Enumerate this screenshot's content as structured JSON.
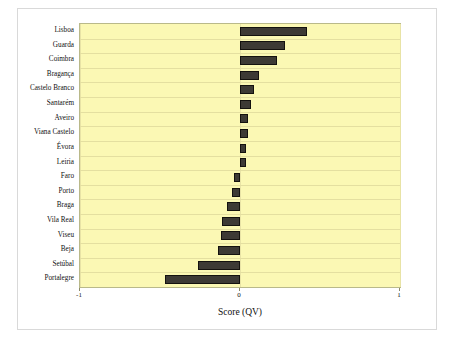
{
  "chart": {
    "type": "bar",
    "orientation": "horizontal",
    "background": "#fbf8b4",
    "bar_color": "#3d3a35",
    "bar_edge_color": "#14120f",
    "frame_color": "#d9d9d9",
    "gridline_color": "#e4dfa0"
  },
  "chart_data": {
    "type": "bar",
    "title": "",
    "xlabel": "Score (QV)",
    "ylabel": "",
    "xlim": [
      -1,
      1
    ],
    "xticks": [
      -1,
      0,
      1
    ],
    "xticklabels": [
      "-1",
      "0",
      "1"
    ],
    "grid": true,
    "legend": null,
    "categories": [
      "Lisboa",
      "Guarda",
      "Coimbra",
      "Bragança",
      "Castelo Branco",
      "Santarém",
      "Aveiro",
      "Viana Castelo",
      "Évora",
      "Leiria",
      "Faro",
      "Porto",
      "Braga",
      "Vila Real",
      "Viseu",
      "Beja",
      "Setúbal",
      "Portalegre"
    ],
    "values": [
      0.42,
      0.28,
      0.23,
      0.12,
      0.09,
      0.07,
      0.05,
      0.05,
      0.04,
      0.04,
      -0.04,
      -0.05,
      -0.08,
      -0.11,
      -0.12,
      -0.14,
      -0.26,
      -0.47
    ]
  }
}
